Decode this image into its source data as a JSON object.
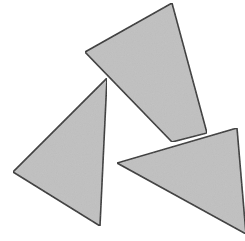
{
  "figure": {
    "width": 245,
    "height": 241,
    "background_color": "#ffffff",
    "fill_color": "#c0c0c0",
    "stroke_color": "#333333",
    "stroke_width": 1.6,
    "texture": "subtle-gray-noise",
    "shape_count": 3,
    "arrangement": "pinwheel",
    "shapes": [
      {
        "name": "triangle-top",
        "label": "Top triangle",
        "z_order": 1,
        "fill": "#c0c0c0",
        "stroke": "#333333",
        "points": "172,3 85,52 172,142 207,133",
        "vertices": [
          {
            "x": 172,
            "y": 3
          },
          {
            "x": 85,
            "y": 52
          },
          {
            "x": 172,
            "y": 142
          },
          {
            "x": 207,
            "y": 133
          }
        ]
      },
      {
        "name": "triangle-left",
        "label": "Left triangle",
        "z_order": 2,
        "fill": "#c0c0c0",
        "stroke": "#333333",
        "points": "107,78 13,172 100,226",
        "vertices": [
          {
            "x": 107,
            "y": 78
          },
          {
            "x": 13,
            "y": 172
          },
          {
            "x": 100,
            "y": 226
          }
        ]
      },
      {
        "name": "triangle-bottom-right",
        "label": "Bottom right triangle",
        "z_order": 3,
        "fill": "#c0c0c0",
        "stroke": "#333333",
        "points": "237,128 117,163 246,234",
        "vertices": [
          {
            "x": 237,
            "y": 128
          },
          {
            "x": 117,
            "y": 163
          },
          {
            "x": 246,
            "y": 234
          }
        ]
      }
    ]
  }
}
